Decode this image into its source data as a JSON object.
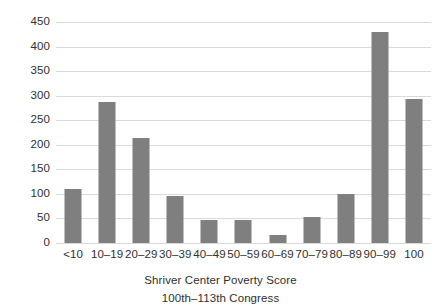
{
  "chart_data": {
    "type": "bar",
    "title": "",
    "subtitle": "",
    "xlabel": "Shriver Center Poverty Score",
    "xlabel_sub": "100th–113th Congress",
    "ylabel": "",
    "categories": [
      "<10",
      "10–19",
      "20–29",
      "30–39",
      "40–49",
      "50–59",
      "60–69",
      "70–79",
      "80–89",
      "90–99",
      "100"
    ],
    "values": [
      110,
      287,
      214,
      96,
      47,
      46,
      16,
      52,
      100,
      430,
      293
    ],
    "ylim": [
      0,
      450
    ],
    "ytick_step": 50,
    "yticks": [
      0,
      50,
      100,
      150,
      200,
      250,
      300,
      350,
      400,
      450
    ],
    "ytick_labels": [
      "0",
      "50",
      "100",
      "150",
      "200",
      "250",
      "300",
      "350",
      "400",
      "450"
    ],
    "grid": true,
    "grid_axis": "y",
    "legend": false,
    "legend_position": "none",
    "bar_color": "#7f7f7f",
    "grid_color": "#d9d9d9",
    "text_color": "#2f2f2f",
    "background_color": "#ffffff"
  }
}
